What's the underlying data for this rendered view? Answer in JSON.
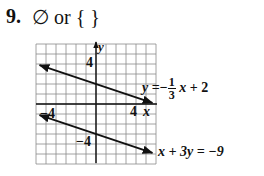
{
  "problem": {
    "number": "9.",
    "answer": "∅ or { }"
  },
  "equations": {
    "line1": {
      "lhs": "y",
      "eq": "=",
      "sign": "−",
      "num": "1",
      "den": "3",
      "rest_var": "x",
      "rest": "+ 2"
    },
    "line2": {
      "text": "x + 3y = −9"
    }
  },
  "axes": {
    "x_label": "x",
    "y_label": "y",
    "tick_x_pos": "4",
    "tick_x_neg": "−4",
    "tick_y_pos": "4",
    "tick_y_neg": "−4"
  },
  "chart_data": {
    "type": "line",
    "xlabel": "x",
    "ylabel": "y",
    "xlim": [
      -6,
      6
    ],
    "ylim": [
      -6,
      6
    ],
    "grid": true,
    "tick_labels": {
      "x": [
        "-4",
        "4"
      ],
      "y": [
        "-4",
        "4"
      ]
    },
    "series": [
      {
        "name": "y = -1/3 x + 2",
        "x": [
          -6,
          6
        ],
        "y": [
          4,
          0
        ],
        "arrows": "both"
      },
      {
        "name": "x + 3y = -9",
        "x": [
          -6,
          6
        ],
        "y": [
          -1,
          -5
        ],
        "arrows": "both"
      }
    ],
    "annotations": [
      "Parallel lines: no solution",
      "∅ or { }"
    ]
  }
}
